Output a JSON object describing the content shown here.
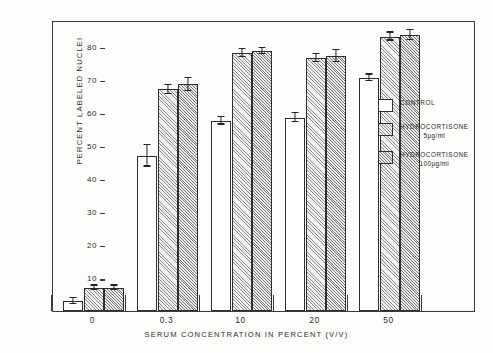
{
  "figure": {
    "background_color": "#fdfdfc",
    "ink_color": "#2b2b2b"
  },
  "chart_data": {
    "type": "bar",
    "title": "",
    "subtitle": "",
    "xlabel": "SERUM CONCENTRATION IN PERCENT (V/V)",
    "ylabel": "PERCENT LABELED NUCLEI",
    "categories": [
      "0",
      "0.3",
      "10",
      "20",
      "50"
    ],
    "ylim": [
      0,
      88
    ],
    "yticks": [
      10,
      20,
      30,
      40,
      50,
      60,
      70,
      80
    ],
    "ytick_labels": [
      "10",
      "20",
      "30",
      "40",
      "50",
      "60",
      "70",
      "80"
    ],
    "grid": false,
    "legend_position": "right",
    "error_bars": "visible",
    "series": [
      {
        "name": "CONTROL",
        "fill": "white",
        "values": [
          3.0,
          47.0,
          57.5,
          58.5,
          70.5
        ],
        "errors": [
          0.8,
          3.3,
          1.1,
          1.3,
          1.0
        ]
      },
      {
        "name": "HYDROCORTISONE 5µg/ml",
        "fill": "hatched",
        "values": [
          7.0,
          67.0,
          78.0,
          76.5,
          83.0
        ],
        "errors": [
          0.7,
          1.3,
          1.2,
          1.3,
          1.2
        ]
      },
      {
        "name": "HYDROCORTISONE 100µg/ml",
        "fill": "hatched-dense",
        "values": [
          7.0,
          68.5,
          78.5,
          77.0,
          83.5
        ],
        "errors": [
          0.7,
          1.9,
          0.9,
          1.8,
          1.6
        ]
      }
    ]
  },
  "legend": {
    "items": [
      {
        "label": "CONTROL",
        "sublabel": "",
        "swatch": "control"
      },
      {
        "label": "HYDROCORTISONE",
        "sublabel": "5µg/ml",
        "swatch": "hc5"
      },
      {
        "label": "HYDROCORTISONE",
        "sublabel": "100µg/ml",
        "swatch": "hc100"
      }
    ]
  }
}
